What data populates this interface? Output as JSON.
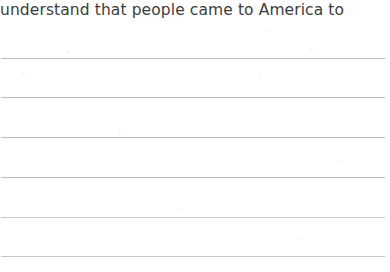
{
  "document": {
    "type": "handwriting-practice-worksheet",
    "background_color": "#ffffff",
    "prompt": {
      "text": "understand that people came to America to",
      "color": "#3d3d3d",
      "font_size_px": 15.5,
      "truncated_left": true,
      "truncated_right": true
    },
    "ruled_lines": {
      "count": 6,
      "color": "#b9bcc0",
      "thickness_px": 1,
      "left_px": 1,
      "width_px": 384,
      "spacing_px": 39.6,
      "positions_px": [
        58,
        97,
        137,
        177,
        217,
        256
      ]
    },
    "writing_rows": [
      {
        "index": 1,
        "value": ""
      },
      {
        "index": 2,
        "value": ""
      },
      {
        "index": 3,
        "value": ""
      },
      {
        "index": 4,
        "value": ""
      },
      {
        "index": 5,
        "value": ""
      },
      {
        "index": 6,
        "value": ""
      }
    ]
  }
}
